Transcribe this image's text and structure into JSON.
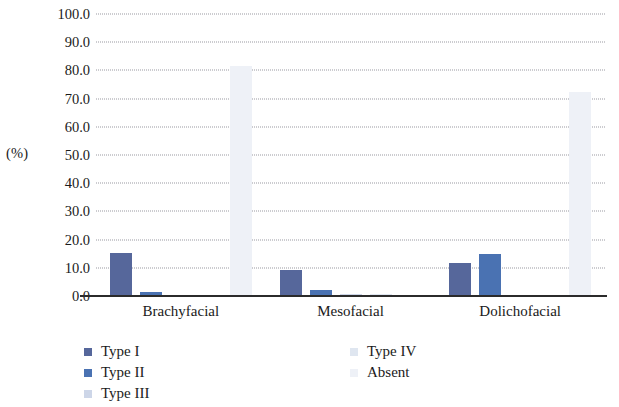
{
  "chart_data": {
    "type": "bar",
    "title": "",
    "subtitle": "",
    "xlabel": "",
    "ylabel": "(%)",
    "ylim": [
      0,
      100
    ],
    "ytick_step": 10,
    "ytick_labels": [
      "100.0",
      "90.0",
      "80.0",
      "70.0",
      "60.0",
      "50.0",
      "40.0",
      "30.0",
      "20.0",
      "10.0",
      "0.0"
    ],
    "grid": "horizontal-dotted",
    "legend_position": "bottom",
    "categories": [
      "Brachyfacial",
      "Mesofacial",
      "Dolichofacial"
    ],
    "series": [
      {
        "name": "Type I",
        "color": "#56679b",
        "values": [
          15.2,
          9.2,
          11.7
        ]
      },
      {
        "name": "Type II",
        "color": "#4a72b2",
        "values": [
          1.5,
          2.1,
          14.9
        ]
      },
      {
        "name": "Type III",
        "color": "#cdd6e8",
        "values": [
          0.0,
          0.7,
          0.0
        ]
      },
      {
        "name": "Type IV",
        "color": "#dfe6f0",
        "values": [
          0.0,
          0.6,
          0.0
        ]
      },
      {
        "name": "Absent",
        "color": "#eef1f7",
        "values": [
          81.5,
          0.0,
          72.5
        ]
      }
    ]
  },
  "axis": {
    "unit_label": "(%)"
  },
  "legend": {
    "left_column": [
      {
        "label": "Type I",
        "color": "#56679b"
      },
      {
        "label": "Type II",
        "color": "#4a72b2"
      },
      {
        "label": "Type III",
        "color": "#cdd6e8"
      }
    ],
    "right_column": [
      {
        "label": "Type IV",
        "color": "#dfe6f0"
      },
      {
        "label": "Absent",
        "color": "#eef1f7"
      }
    ]
  }
}
